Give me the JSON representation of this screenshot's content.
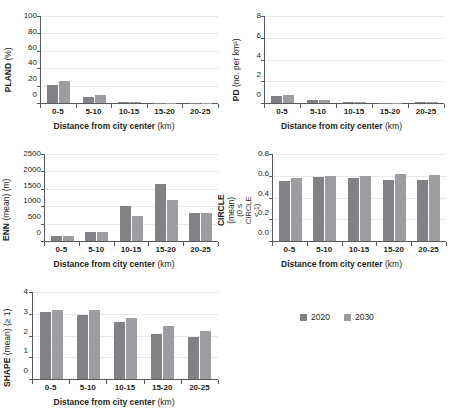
{
  "figure": {
    "categories": [
      "0-5",
      "5-10",
      "10-15",
      "15-20",
      "20-25"
    ],
    "xlabel_main": "Distance from city center",
    "xlabel_unit": "(km)",
    "colors": {
      "series_2020": "#808285",
      "series_2030": "#9b9da0",
      "axis": "#58595b",
      "grid": "#e9e9e9"
    },
    "legend": {
      "position": "bottom-right",
      "items": [
        {
          "label": "2020",
          "color": "#808285"
        },
        {
          "label": "2030",
          "color": "#9b9da0"
        }
      ]
    }
  },
  "chart_data": [
    {
      "id": "pland",
      "type": "bar",
      "title": "",
      "ylabel": "PLAND (%)",
      "ylabel_bold": "PLAND",
      "ylabel_unit": "(%)",
      "xlabel": "Distance from city center (km)",
      "categories": [
        "0-5",
        "5-10",
        "10-15",
        "15-20",
        "20-25"
      ],
      "yticks": [
        "0",
        "20",
        "40",
        "60",
        "80",
        "100"
      ],
      "ylim": [
        0,
        100
      ],
      "grid": true,
      "series": [
        {
          "name": "2020",
          "values": [
            20.5,
            7.0,
            0.8,
            0.1,
            0.2
          ]
        },
        {
          "name": "2030",
          "values": [
            25.5,
            9.0,
            1.3,
            0.1,
            0.3
          ]
        }
      ]
    },
    {
      "id": "pd",
      "type": "bar",
      "title": "",
      "ylabel": "PD (no. per km²)",
      "ylabel_bold": "PD",
      "ylabel_unit": "(no. per km²)",
      "xlabel": "Distance from city center (km)",
      "categories": [
        "0-5",
        "5-10",
        "10-15",
        "15-20",
        "20-25"
      ],
      "yticks": [
        "0",
        "2",
        "4",
        "6",
        "8"
      ],
      "ylim": [
        0,
        8
      ],
      "grid": true,
      "series": [
        {
          "name": "2020",
          "values": [
            0.68,
            0.27,
            0.1,
            0.03,
            0.05
          ]
        },
        {
          "name": "2030",
          "values": [
            0.78,
            0.3,
            0.12,
            0.03,
            0.06
          ]
        }
      ]
    },
    {
      "id": "enn",
      "type": "bar",
      "title": "",
      "ylabel": "ENN (mean) (m)",
      "ylabel_bold": "ENN",
      "ylabel_unit": "(mean) (m)",
      "xlabel": "Distance from city center (km)",
      "categories": [
        "0-5",
        "5-10",
        "10-15",
        "15-20",
        "20-25"
      ],
      "yticks": [
        "0",
        "500",
        "1000",
        "1500",
        "2000",
        "2500"
      ],
      "ylim": [
        0,
        2500
      ],
      "grid": true,
      "series": [
        {
          "name": "2020",
          "values": [
            135,
            270,
            1010,
            1630,
            800
          ]
        },
        {
          "name": "2030",
          "values": [
            135,
            245,
            720,
            1180,
            795
          ]
        }
      ]
    },
    {
      "id": "circle",
      "type": "bar",
      "title": "",
      "ylabel": "CIRCLE (mean) (0 ≤ CIRCLE < 1)",
      "ylabel_bold": "CIRCLE",
      "ylabel_unit": "(mean)",
      "ylabel_sub": "(0 ≤ CIRCLE < 1)",
      "xlabel": "Distance from city center (km)",
      "categories": [
        "0-5",
        "5-10",
        "10-15",
        "15-20",
        "20-25"
      ],
      "yticks": [
        "0.0",
        "0.2",
        "0.4",
        "0.6",
        "0.8"
      ],
      "ylim": [
        0,
        0.8
      ],
      "grid": true,
      "series": [
        {
          "name": "2020",
          "values": [
            0.555,
            0.585,
            0.575,
            0.562,
            0.56
          ]
        },
        {
          "name": "2030",
          "values": [
            0.58,
            0.6,
            0.595,
            0.618,
            0.605
          ]
        }
      ]
    },
    {
      "id": "shape",
      "type": "bar",
      "title": "",
      "ylabel": "SHAPE (mean) (≥ 1)",
      "ylabel_bold": "SHAPE",
      "ylabel_unit": "(mean) (≥ 1)",
      "xlabel": "Distance from city center (km)",
      "categories": [
        "0-5",
        "5-10",
        "10-15",
        "15-20",
        "20-25"
      ],
      "yticks": [
        "0",
        "1",
        "2",
        "3",
        "4"
      ],
      "ylim": [
        0,
        4
      ],
      "grid": true,
      "series": [
        {
          "name": "2020",
          "values": [
            3.09,
            2.96,
            2.6,
            2.06,
            1.91
          ]
        },
        {
          "name": "2030",
          "values": [
            3.19,
            3.17,
            2.79,
            2.43,
            2.19
          ]
        }
      ]
    }
  ]
}
